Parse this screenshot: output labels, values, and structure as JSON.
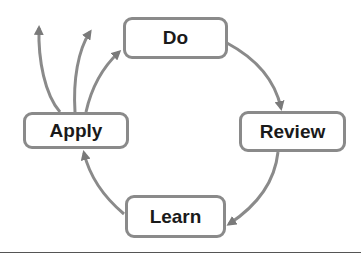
{
  "diagram": {
    "type": "cycle",
    "nodes": [
      {
        "id": "do",
        "label": "Do"
      },
      {
        "id": "review",
        "label": "Review"
      },
      {
        "id": "learn",
        "label": "Learn"
      },
      {
        "id": "apply",
        "label": "Apply"
      }
    ],
    "edges": [
      {
        "from": "do",
        "to": "review"
      },
      {
        "from": "review",
        "to": "learn"
      },
      {
        "from": "learn",
        "to": "apply"
      },
      {
        "from": "apply",
        "to": "do"
      },
      {
        "from": "apply",
        "to": "outward-1"
      },
      {
        "from": "apply",
        "to": "outward-2"
      }
    ],
    "colors": {
      "stroke": "#8a8a8a",
      "text": "#1a1a1a",
      "background": "#ffffff"
    }
  }
}
